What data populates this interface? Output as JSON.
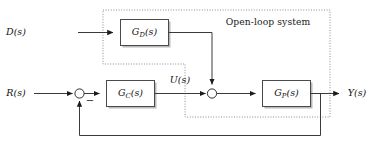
{
  "diagram": {
    "type": "control-system-block-diagram",
    "boundary_label": "Open-loop system",
    "signals": {
      "reference": "R(s)",
      "disturbance": "D(s)",
      "control": "U(s)",
      "output": "Y(s)"
    },
    "sum_signs": {
      "feedback": "−"
    },
    "blocks": [
      {
        "id": "gd",
        "base": "G",
        "subscript": "D",
        "arg": "(s)",
        "label": "G_D(s)"
      },
      {
        "id": "gc",
        "base": "G",
        "subscript": "C",
        "arg": "(s)",
        "label": "G_C(s)"
      },
      {
        "id": "gp",
        "base": "G",
        "subscript": "P",
        "arg": "(s)",
        "label": "G_P(s)"
      }
    ],
    "junctions": [
      {
        "id": "sum-error",
        "inputs": [
          "R(s)",
          "feedback"
        ],
        "sign": "−"
      },
      {
        "id": "sum-disturbance",
        "inputs": [
          "U(s)",
          "G_D(s)"
        ]
      }
    ],
    "colors": {
      "wire": "#3a3a3a",
      "block_stroke": "#4a4a4a",
      "block_fill": "#ffffff",
      "block_shadow": "#b9b9b9",
      "boundary": "#8c8c8c",
      "text": "#111111",
      "background": "#ffffff"
    }
  }
}
